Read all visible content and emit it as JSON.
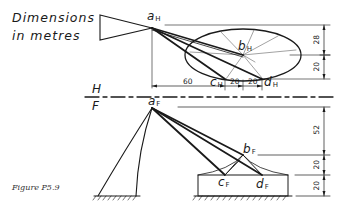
{
  "diagram": {
    "title_line1": "Dimensions",
    "title_line2": "in metres",
    "caption": "Figure P5.9",
    "planes": {
      "horizontal": "H",
      "frontal": "F"
    },
    "points_plan": {
      "a": {
        "letter": "a",
        "sub": "H"
      },
      "b": {
        "letter": "b",
        "sub": "H"
      },
      "c": {
        "letter": "c",
        "sub": "H"
      },
      "d": {
        "letter": "d",
        "sub": "H"
      }
    },
    "points_elevation": {
      "a": {
        "letter": "a",
        "sub": "F"
      },
      "b": {
        "letter": "b",
        "sub": "F"
      },
      "c": {
        "letter": "c",
        "sub": "F"
      },
      "d": {
        "letter": "d",
        "sub": "F"
      }
    },
    "plan_dimensions": {
      "horizontal": [
        "60",
        "20",
        "20"
      ],
      "vertical": [
        "28",
        "20"
      ]
    },
    "elevation_dimensions": {
      "vertical": [
        "52",
        "20",
        "20"
      ]
    },
    "line_color": "#1a1a1a"
  }
}
